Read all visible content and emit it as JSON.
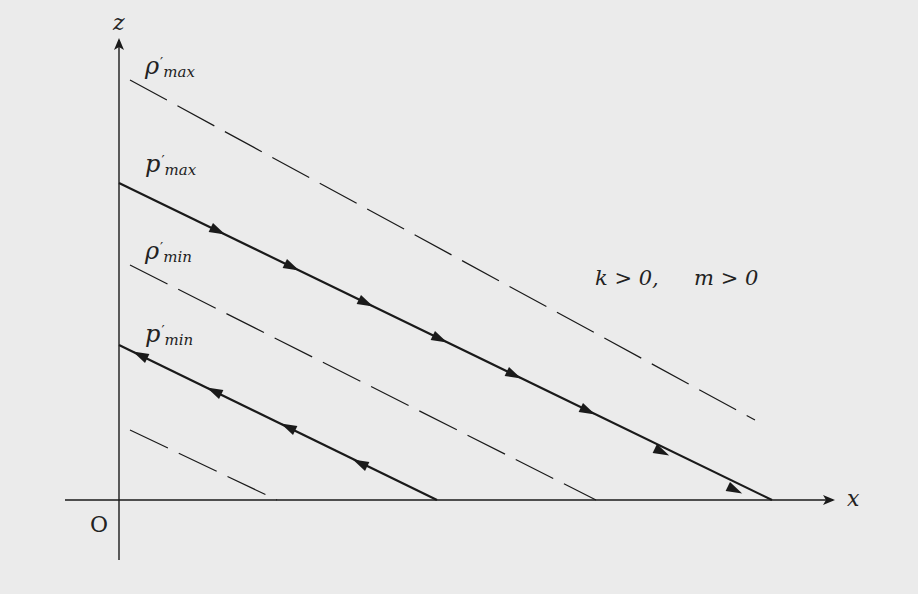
{
  "diagram": {
    "axes": {
      "x_label": "x",
      "z_label": "z",
      "origin_label": "O"
    },
    "lines": [
      {
        "id": "rho_max",
        "symbol": "ρ",
        "subscript": "max",
        "style": "dashed",
        "direction": "none"
      },
      {
        "id": "p_max",
        "symbol": "p",
        "subscript": "max",
        "style": "solid",
        "direction": "down-right"
      },
      {
        "id": "rho_min",
        "symbol": "ρ",
        "subscript": "min",
        "style": "dashed",
        "direction": "none"
      },
      {
        "id": "p_min",
        "symbol": "p",
        "subscript": "min",
        "style": "solid",
        "direction": "up-left"
      },
      {
        "id": "lower",
        "symbol": "",
        "subscript": "",
        "style": "dashed",
        "direction": "none"
      }
    ],
    "condition": {
      "k": "k > 0,",
      "m": "m > 0"
    },
    "colors": {
      "background": "#ebebeb",
      "ink": "#1a1a1a"
    }
  }
}
